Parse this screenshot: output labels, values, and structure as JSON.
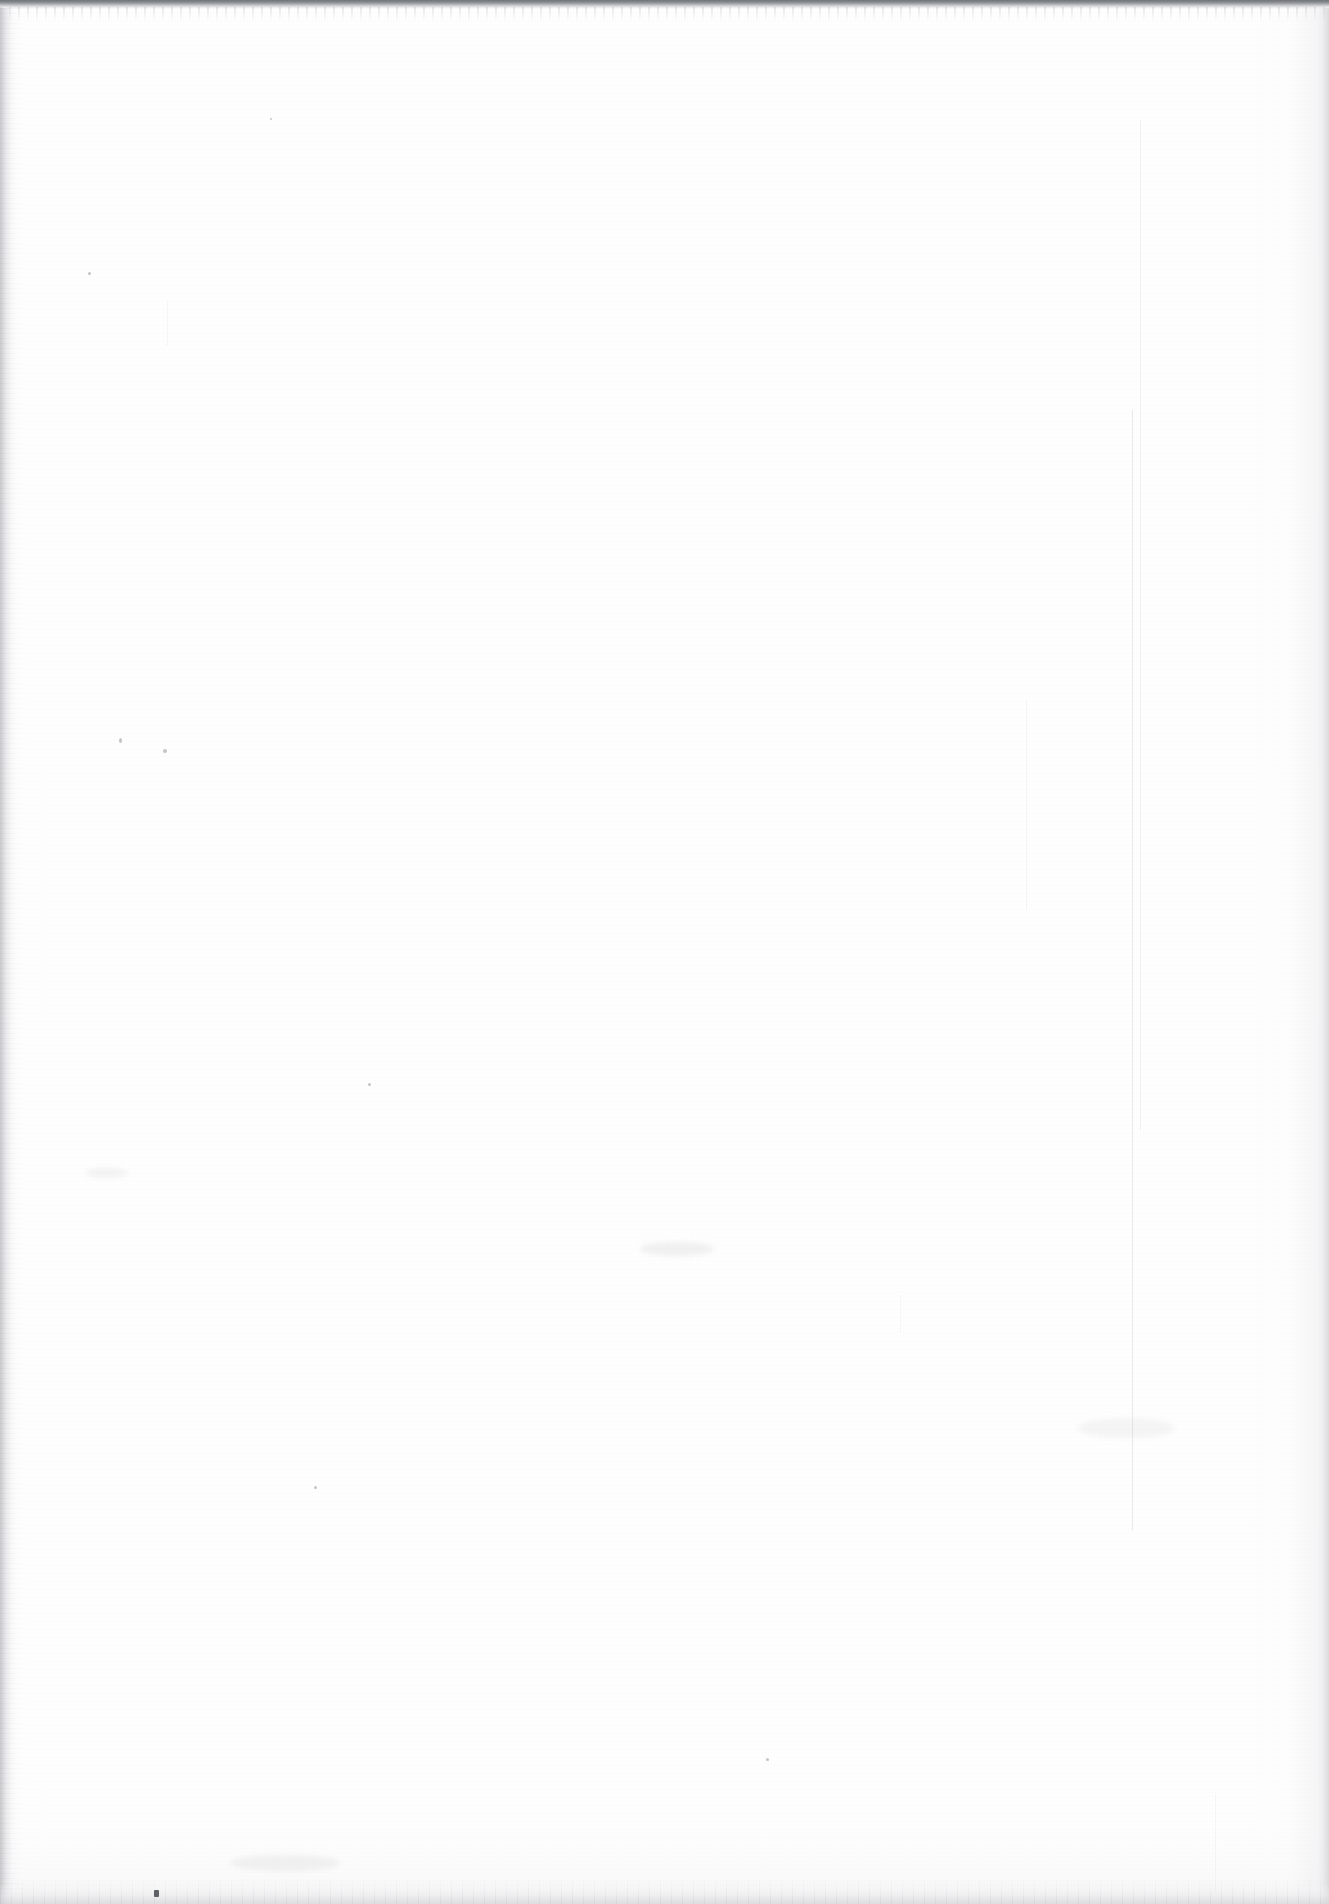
{
  "document": {
    "page_kind": "blank-scanned-page",
    "page_text": "",
    "accessible_description": "Blank page"
  },
  "canvas": {
    "width_px": 1329,
    "height_px": 1904,
    "background_color": "#fefefe",
    "paper_tone": "#ffffff"
  },
  "artifacts": {
    "top_edge": {
      "name": "scanner-bed-edge",
      "color": "#6f7276",
      "height_px": 9
    },
    "left_edge": {
      "name": "binding-edge-shadow",
      "color": "#c6c6ca",
      "width_px": 17
    },
    "right_edge": {
      "name": "outer-page-edge",
      "color": "#ceced2",
      "width_px": 16
    },
    "bottom_edge": {
      "name": "bottom-page-edge",
      "color": "#d6d6d9",
      "height_px": 20
    },
    "streaks": [
      {
        "name": "vertical-scan-streak",
        "x_px": 1132,
        "y_px": 410,
        "length_px": 1120
      },
      {
        "name": "vertical-scan-streak",
        "x_px": 1140,
        "y_px": 120,
        "length_px": 1010
      },
      {
        "name": "vertical-scan-streak",
        "x_px": 1026,
        "y_px": 700,
        "length_px": 210
      },
      {
        "name": "vertical-scan-streak",
        "x_px": 167,
        "y_px": 300,
        "length_px": 46
      },
      {
        "name": "vertical-scan-streak",
        "x_px": 1215,
        "y_px": 1795,
        "length_px": 96
      },
      {
        "name": "vertical-scan-streak",
        "x_px": 900,
        "y_px": 1295,
        "length_px": 38
      }
    ],
    "specks": [
      {
        "name": "dust-speck",
        "x_px": 154,
        "y_px": 1890,
        "color": "#3f4145"
      },
      {
        "name": "dust-speck",
        "x_px": 163,
        "y_px": 749,
        "color": "#6e6e76"
      },
      {
        "name": "dust-speck",
        "x_px": 314,
        "y_px": 1486,
        "color": "#6e6e76"
      }
    ],
    "smudges": [
      {
        "name": "faint-smudge",
        "x_px": 640,
        "y_px": 1242
      },
      {
        "name": "faint-smudge",
        "x_px": 230,
        "y_px": 1855
      },
      {
        "name": "faint-smudge",
        "x_px": 1078,
        "y_px": 1418
      },
      {
        "name": "faint-smudge",
        "x_px": 86,
        "y_px": 1168
      }
    ]
  }
}
